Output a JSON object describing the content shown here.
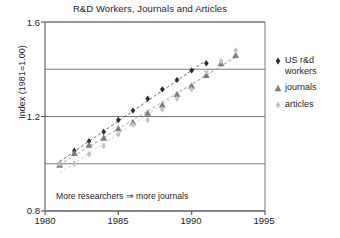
{
  "chart_data": {
    "type": "scatter",
    "title": "R&D Workers, Journals and Articles",
    "xlabel": "",
    "ylabel": "Index (1981=1.00)",
    "xlim": [
      1980,
      1995
    ],
    "ylim": [
      0.8,
      1.6
    ],
    "grid": true,
    "legend_position": "right-outside",
    "x_ticks": [
      1980,
      1985,
      1990,
      1995
    ],
    "x_tick_labels": [
      "1980",
      "1985",
      "1990",
      "1995"
    ],
    "y_ticks": [
      0.8,
      1.2,
      1.6
    ],
    "y_tick_labels": [
      "0.8",
      "1.2",
      "1.6"
    ],
    "y_gridlines": [
      0.8,
      1.0,
      1.2,
      1.4,
      1.6
    ],
    "annotation": "More researchers ⇒ more journals",
    "x": [
      1981,
      1982,
      1983,
      1984,
      1985,
      1986,
      1987,
      1988,
      1989,
      1990,
      1991,
      1992,
      1993
    ],
    "series": [
      {
        "name": "US r&d workers",
        "marker": "diamond",
        "color": "#2b2b2b",
        "trendline": true,
        "values": [
          1.0,
          1.055,
          1.095,
          1.135,
          1.185,
          1.225,
          1.275,
          1.315,
          1.355,
          1.395,
          1.425,
          null,
          null
        ]
      },
      {
        "name": "journals",
        "marker": "triangle",
        "color": "#7d7d7d",
        "trendline": true,
        "values": [
          0.995,
          1.045,
          1.08,
          1.11,
          1.15,
          1.175,
          1.215,
          1.25,
          1.295,
          1.33,
          1.375,
          1.425,
          1.46
        ]
      },
      {
        "name": "articles",
        "marker": "diamond",
        "color": "#c2c2c2",
        "trendline": true,
        "values": [
          1.0,
          1.0,
          1.04,
          1.075,
          1.125,
          1.165,
          1.185,
          1.23,
          1.275,
          1.315,
          1.39,
          1.435,
          1.48
        ]
      }
    ]
  },
  "legend": {
    "items": [
      {
        "label_line1": "US r&d",
        "label_line2": "workers",
        "marker": "diamond-dark-icon"
      },
      {
        "label_line1": "journals",
        "label_line2": "",
        "marker": "triangle-gray-icon"
      },
      {
        "label_line1": "articles",
        "label_line2": "",
        "marker": "diamond-light-icon"
      }
    ]
  },
  "colors": {
    "workers": "#2b2b2b",
    "journals": "#7d7d7d",
    "articles": "#c2c2c2",
    "axis": "#555555",
    "grid": "#6a6a6a"
  }
}
